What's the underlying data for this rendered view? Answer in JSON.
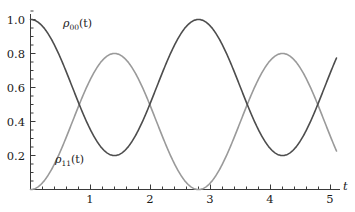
{
  "chart_data": {
    "type": "line",
    "title": "",
    "xlabel": "t",
    "ylabel": "",
    "xlim": [
      0,
      5.1
    ],
    "ylim": [
      0,
      1.05
    ],
    "grid": false,
    "legend": "inline-annotations",
    "xticks": [
      "1",
      "2",
      "3",
      "4",
      "5"
    ],
    "xtick_values": [
      1,
      2,
      3,
      4,
      5
    ],
    "yticks": [
      "0.2",
      "0.4",
      "0.6",
      "0.8",
      "1.0"
    ],
    "ytick_values": [
      0.2,
      0.4,
      0.6,
      0.8,
      1.0
    ],
    "x_minor_tick_step": 0.2,
    "y_minor_tick_step": 0.05,
    "series": [
      {
        "name": "rho_00(t)",
        "label_html": "ρ<sub>00</sub>(t)",
        "color": "#4d4d4d",
        "linewidth": 1.6,
        "description": "0.6 + 0.4*cos(2.24*t)",
        "amplitude": 0.4,
        "offset": 0.6,
        "period": 2.8,
        "max": 1.0,
        "min": 0.2,
        "value_at_0": 1.0,
        "value_at_end": 0.67
      },
      {
        "name": "rho_11(t)",
        "label_html": "ρ<sub>11</sub>(t)",
        "color": "#9a9a9a",
        "linewidth": 1.6,
        "description": "0.4 - 0.4*cos(2.24*t)",
        "amplitude": 0.4,
        "offset": 0.4,
        "period": 2.8,
        "max": 0.8,
        "min": 0.0,
        "value_at_0": 0.0,
        "value_at_end": 0.33
      }
    ],
    "annotations": [
      {
        "name": "rho00-label",
        "text": "ρ00(t)",
        "x": 0.72,
        "y": 0.93
      },
      {
        "name": "rho11-label",
        "text": "ρ11(t)",
        "x": 0.55,
        "y": 0.22
      }
    ]
  },
  "axes": {
    "x_axis_name": "t",
    "y_tick_labels": [
      "1.0",
      "0.8",
      "0.6",
      "0.4",
      "0.2"
    ],
    "x_tick_labels": [
      "1",
      "2",
      "3",
      "4",
      "5"
    ]
  },
  "labels": {
    "rho00_rho": "ρ",
    "rho00_sub": "00",
    "rho00_arg": "(t)",
    "rho11_rho": "ρ",
    "rho11_sub": "11",
    "rho11_arg": "(t)"
  },
  "colors": {
    "curve_dark": "#4d4d4d",
    "curve_light": "#9a9a9a",
    "axis": "#3a3a3a",
    "text": "#1a1a1a",
    "background": "#ffffff"
  }
}
